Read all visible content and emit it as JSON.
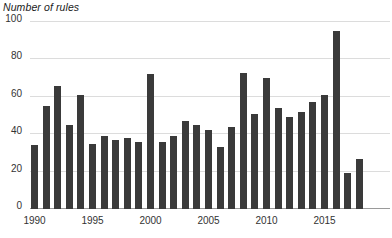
{
  "chart_data": {
    "type": "bar",
    "title": "Number of rules",
    "xlabel": "",
    "ylabel": "Number of rules",
    "ylim": [
      0,
      100
    ],
    "ytick_values": [
      0,
      20,
      40,
      60,
      80,
      100
    ],
    "ytick_labels": [
      "0",
      "20",
      "40",
      "60",
      "80",
      "100"
    ],
    "xtick_labels": [
      "1990",
      "1995",
      "2000",
      "2005",
      "2010",
      "2015"
    ],
    "xtick_categories": [
      "1990",
      "1995",
      "2000",
      "2005",
      "2010",
      "2015"
    ],
    "grid": "horizontal",
    "legend": "none",
    "bar_color": "#3a3a3a",
    "gridline_color": "#dcdcdc",
    "axis_color": "#9a9a9a",
    "categories": [
      "1990",
      "1991",
      "1992",
      "1993",
      "1994",
      "1995",
      "1996",
      "1997",
      "1998",
      "1999",
      "2000",
      "2001",
      "2002",
      "2003",
      "2004",
      "2005",
      "2006",
      "2007",
      "2008",
      "2009",
      "2010",
      "2011",
      "2012",
      "2013",
      "2014",
      "2015",
      "2016",
      "2017",
      "2018"
    ],
    "values": [
      34,
      55,
      66,
      45,
      61,
      35,
      39,
      37,
      38,
      36,
      72,
      36,
      39,
      47,
      45,
      42,
      33,
      44,
      73,
      51,
      70,
      54,
      49,
      52,
      57,
      61,
      95,
      19,
      27
    ]
  }
}
